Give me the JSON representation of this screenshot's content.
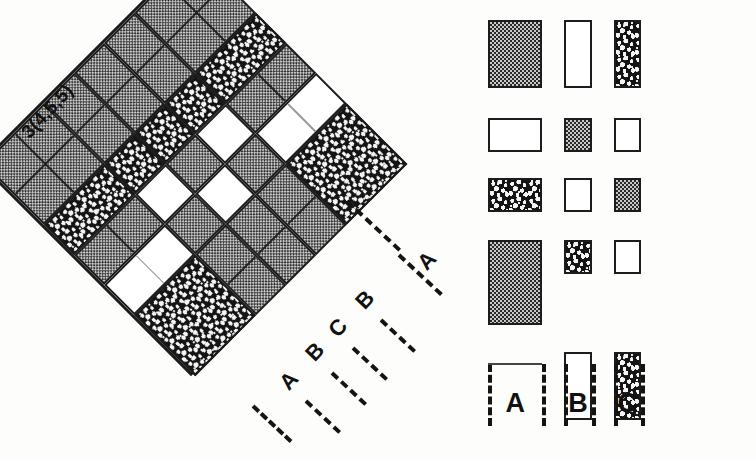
{
  "figure": {
    "title_label": "3(4,5,5)",
    "diamond": {
      "rotation_deg": -45,
      "edge_labels_outer": [
        "A",
        "B",
        "C",
        "B",
        "A"
      ],
      "macro_grid_cols": 5,
      "macro_grid_rows": 5,
      "col_types": [
        "A",
        "B",
        "C",
        "B",
        "A"
      ],
      "row_types": [
        "A",
        "B",
        "C",
        "B",
        "A"
      ],
      "cell_fills": [
        [
          "check",
          "check",
          "check",
          "check",
          "check"
        ],
        [
          "speck",
          "speck",
          "speck",
          "speck",
          "speck"
        ],
        [
          "check",
          "white",
          "check",
          "white",
          "check"
        ],
        [
          "white",
          "check",
          "white",
          "check",
          "white"
        ],
        [
          "speck",
          "check",
          "check",
          "check",
          "speck"
        ]
      ],
      "cell_fills_note": "5x5 macro blocks; fill = check (halftone checker), white (empty), speck (dark speckled)"
    },
    "legend": {
      "columns": [
        {
          "label": "A",
          "width_units": 4
        },
        {
          "label": "B",
          "width_units": 2
        },
        {
          "label": "C",
          "width_units": 2
        }
      ],
      "rows": [
        {
          "units": 4,
          "cells": [
            {
              "col": "A",
              "fill": "check",
              "cols": 4,
              "rows": 4
            },
            {
              "col": "B",
              "fill": "white",
              "cols": 2,
              "rows": 4
            },
            {
              "col": "C",
              "fill": "speck",
              "cols": 2,
              "rows": 4
            }
          ]
        },
        {
          "units": 2,
          "cells": [
            {
              "col": "A",
              "fill": "white",
              "cols": 4,
              "rows": 2
            },
            {
              "col": "B",
              "fill": "check",
              "cols": 2,
              "rows": 2
            },
            {
              "col": "C",
              "fill": "white",
              "cols": 2,
              "rows": 2
            }
          ]
        },
        {
          "units": 2,
          "cells": [
            {
              "col": "A",
              "fill": "speck",
              "cols": 4,
              "rows": 2
            },
            {
              "col": "B",
              "fill": "white",
              "cols": 2,
              "rows": 2
            },
            {
              "col": "C",
              "fill": "check",
              "cols": 2,
              "rows": 2
            }
          ]
        },
        {
          "units": 2,
          "cells": [
            {
              "col": "A",
              "fill": "check",
              "cols": 4,
              "rows": 5
            },
            {
              "col": "B",
              "fill": "speck",
              "cols": 2,
              "rows": 2
            },
            {
              "col": "C",
              "fill": "white",
              "cols": 2,
              "rows": 2
            }
          ]
        },
        {
          "units": 4,
          "cells": [
            {
              "col": "A",
              "fill": "none",
              "cols": 0,
              "rows": 0
            },
            {
              "col": "B",
              "fill": "white",
              "cols": 2,
              "rows": 4
            },
            {
              "col": "C",
              "fill": "speck",
              "cols": 2,
              "rows": 4
            }
          ]
        }
      ]
    },
    "colors": {
      "ink": "#1c1c1c",
      "halftone_gray": "#c9c9c9",
      "speckle_dark": "#141414",
      "paper": "#fdfdfc",
      "subgrid_gray": "#6f6f6f"
    }
  }
}
